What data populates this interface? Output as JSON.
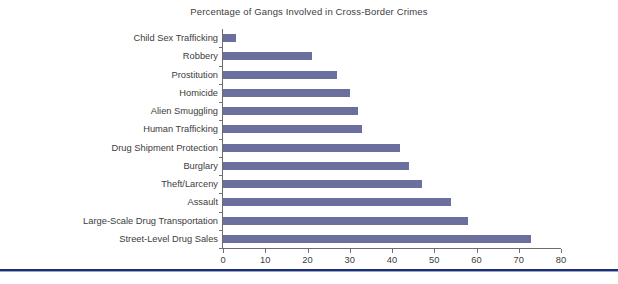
{
  "chart_data": {
    "type": "bar",
    "orientation": "horizontal",
    "title": "Percentage of Gangs Involved in Cross-Border Crimes",
    "xlabel": "",
    "ylabel": "",
    "xlim": [
      0,
      80
    ],
    "xticks": [
      0,
      10,
      20,
      30,
      40,
      50,
      60,
      70,
      80
    ],
    "grid": false,
    "legend": false,
    "bar_color": "#6b6f9e",
    "categories": [
      "Child Sex Trafficking",
      "Robbery",
      "Prostitution",
      "Homicide",
      "Alien Smuggling",
      "Human Trafficking",
      "Drug Shipment Protection",
      "Burglary",
      "Theft/Larceny",
      "Assault",
      "Large-Scale Drug Transportation",
      "Street-Level Drug Sales"
    ],
    "values": [
      3,
      21,
      27,
      30,
      32,
      33,
      42,
      44,
      47,
      54,
      58,
      73
    ]
  },
  "axis": {
    "tick_labels": [
      "0",
      "10",
      "20",
      "30",
      "40",
      "50",
      "60",
      "70",
      "80"
    ]
  }
}
